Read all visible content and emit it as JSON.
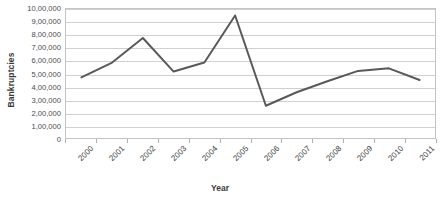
{
  "chart_data": {
    "type": "line",
    "title": "",
    "xlabel": "Year",
    "ylabel": "Bankruptcies",
    "categories": [
      "2000",
      "2001",
      "2002",
      "2003",
      "2004",
      "2005",
      "2006",
      "2007",
      "2008",
      "2009",
      "2010",
      "2011"
    ],
    "values": [
      470000,
      585000,
      775000,
      515000,
      585000,
      950000,
      250000,
      355000,
      440000,
      520000,
      540000,
      450000
    ],
    "series": [
      {
        "name": "Bankruptcies",
        "values": [
          470000,
          585000,
          775000,
          515000,
          585000,
          950000,
          250000,
          355000,
          440000,
          520000,
          540000,
          450000
        ]
      }
    ],
    "ylim": [
      0,
      1000000
    ],
    "ytick_values": [
      0,
      100000,
      200000,
      300000,
      400000,
      500000,
      600000,
      700000,
      800000,
      900000,
      1000000
    ],
    "ytick_labels": [
      "0",
      "1,00,000",
      "2,00,000",
      "3,00,000",
      "4,00,000",
      "5,00,000",
      "6,00,000",
      "7,00,000",
      "8,00,000",
      "9,00,000",
      "10,00,000"
    ],
    "grid": true,
    "grid_axis": "y",
    "legend": false,
    "legend_position": "none",
    "line_color": "#595959",
    "gridline_color": "#d0d0d0",
    "plot_border_color": "#c4c4c4",
    "background_color": "#ffffff",
    "xtick_rotation": -45
  }
}
